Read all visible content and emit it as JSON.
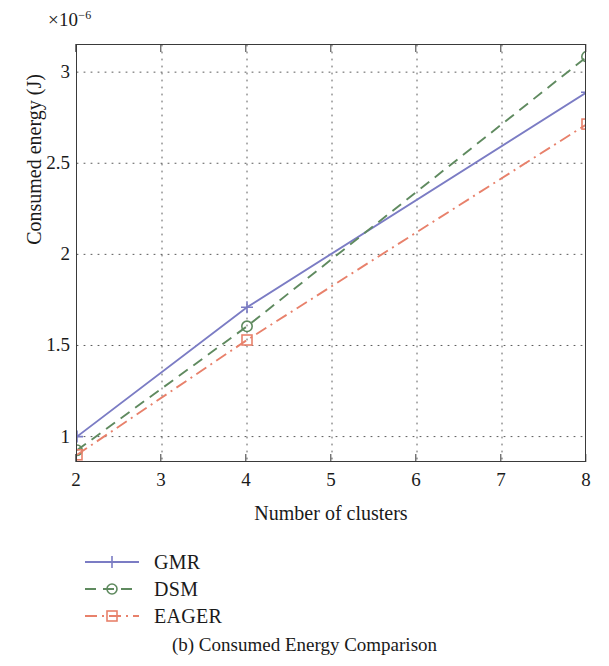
{
  "figure": {
    "caption": "(b) Consumed Energy Comparison",
    "exponent_prefix": "×10",
    "exponent_power": "−6"
  },
  "chart_data": {
    "type": "line",
    "title": "",
    "subtitle": "",
    "xlabel": "Number of clusters",
    "ylabel": "Consumed energy (J)",
    "y_exponent": "×10^-6",
    "xlim": [
      2,
      8
    ],
    "ylim": [
      0.855,
      3.149
    ],
    "xticks": [
      2,
      3,
      4,
      5,
      6,
      7,
      8
    ],
    "xticklabels": [
      "2",
      "3",
      "4",
      "5",
      "6",
      "7",
      "8"
    ],
    "yticks": [
      1,
      1.5,
      2,
      2.5,
      3
    ],
    "yticklabels": [
      "1",
      "1.5",
      "2",
      "2.5",
      "3"
    ],
    "grid": true,
    "grid_style": "dotted",
    "legend_position": "below-left",
    "x": [
      2,
      4,
      8
    ],
    "series": [
      {
        "name": "GMR",
        "values": [
          1.0,
          1.71,
          2.89
        ],
        "color": "#7b7cc4",
        "line_style": "solid",
        "marker": "plus"
      },
      {
        "name": "DSM",
        "values": [
          0.925,
          1.605,
          3.085
        ],
        "color": "#5f8a5f",
        "line_style": "dashed",
        "marker": "circle"
      },
      {
        "name": "EAGER",
        "values": [
          0.9,
          1.53,
          2.715
        ],
        "color": "#e8816b",
        "line_style": "dashdot",
        "marker": "square"
      }
    ]
  },
  "legend": {
    "items": [
      {
        "label": "GMR"
      },
      {
        "label": "DSM"
      },
      {
        "label": "EAGER"
      }
    ]
  },
  "axis": {
    "y_tick_labels": [
      "3",
      "2.5",
      "2",
      "1.5",
      "1"
    ],
    "x_tick_labels": [
      "2",
      "3",
      "4",
      "5",
      "6",
      "7",
      "8"
    ]
  }
}
